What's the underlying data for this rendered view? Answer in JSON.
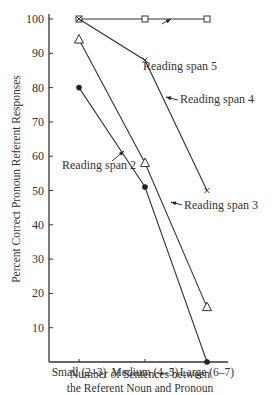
{
  "chart_data": {
    "type": "line",
    "title": "",
    "xlabel": "Number of Sentences between the Referent Noun and Pronoun",
    "xlabel_lines": [
      "Number of Sentences between",
      "the Referent Noun and Pronoun"
    ],
    "ylabel": "Percent Correct Pronoun Referent Responses",
    "categories": [
      "Small (2–3)",
      "Medium (4–5)",
      "Large (6–7)"
    ],
    "ylim": [
      0,
      100
    ],
    "yticks": [
      10,
      20,
      30,
      40,
      50,
      60,
      70,
      80,
      90,
      100
    ],
    "grid": false,
    "legend": "inline annotations with arrows",
    "series": [
      {
        "name": "Reading span 5",
        "marker": "open-square",
        "values": [
          100,
          100,
          100
        ]
      },
      {
        "name": "Reading span 4",
        "marker": "x",
        "values": [
          100,
          88,
          50
        ]
      },
      {
        "name": "Reading span 3",
        "marker": "open-triangle",
        "values": [
          94,
          58,
          16
        ]
      },
      {
        "name": "Reading span 2",
        "marker": "filled-circle",
        "values": [
          80,
          51,
          0
        ]
      }
    ],
    "annotations": [
      {
        "text": "Reading span 5",
        "x": 143,
        "y": 70
      },
      {
        "text": "Reading span 4",
        "x": 180,
        "y": 103
      },
      {
        "text": "Reading span 3",
        "x": 184,
        "y": 209
      },
      {
        "text": "Reading span 2",
        "x": 62,
        "y": 169
      }
    ]
  }
}
